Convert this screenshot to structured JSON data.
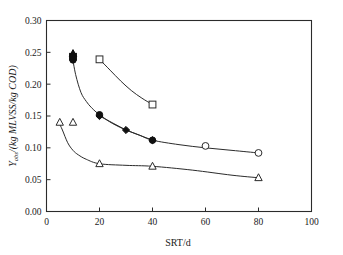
{
  "chart_data": {
    "type": "scatter",
    "title": "",
    "xlabel": "SRT/d",
    "ylabel": "Y_obs/(kg MLVSS/kg COD)",
    "ylabel_main": "Y",
    "ylabel_sub": "obs",
    "ylabel_rest": "/(kg MLVSS/kg COD)",
    "xlim": [
      0,
      100
    ],
    "ylim": [
      0.0,
      0.3
    ],
    "xticks": [
      0,
      20,
      40,
      60,
      80,
      100
    ],
    "xtick_labels": [
      "0",
      "20",
      "40",
      "60",
      "80",
      "100"
    ],
    "yticks": [
      0.0,
      0.05,
      0.1,
      0.15,
      0.2,
      0.25,
      0.3
    ],
    "ytick_labels": [
      "0.00",
      "0.05",
      "0.10",
      "0.15",
      "0.20",
      "0.25",
      "0.30"
    ],
    "grid": false,
    "legend": "none",
    "line_color": "#2b2b2b",
    "marker_open_fill": "#ffffff",
    "marker_filled_fill": "#101010",
    "series": [
      {
        "name": "open-square-series",
        "marker": "open-square",
        "x": [
          20,
          40
        ],
        "values": [
          0.239,
          0.168
        ],
        "curve_x": [
          20,
          24,
          28,
          32,
          36,
          40
        ],
        "curve_y": [
          0.239,
          0.222,
          0.205,
          0.19,
          0.178,
          0.168
        ]
      },
      {
        "name": "filled-cluster-series",
        "marker": "filled-mixed",
        "x": [
          10,
          10,
          10
        ],
        "values": [
          0.248,
          0.243,
          0.238
        ]
      },
      {
        "name": "filled-circle-series",
        "marker": "filled-circle",
        "x": [
          10,
          20,
          40
        ],
        "values": [
          0.243,
          0.152,
          0.112
        ],
        "curve_x": [
          9.6,
          11,
          13,
          15,
          17,
          20,
          25,
          30,
          35,
          40,
          50,
          60,
          70,
          80
        ],
        "curve_y": [
          0.247,
          0.215,
          0.187,
          0.173,
          0.163,
          0.152,
          0.138,
          0.128,
          0.12,
          0.112,
          0.105,
          0.1,
          0.096,
          0.092
        ]
      },
      {
        "name": "filled-diamond-series",
        "marker": "filled-diamond",
        "x": [
          20,
          30,
          40
        ],
        "values": [
          0.15,
          0.128,
          0.112
        ]
      },
      {
        "name": "open-circle-series",
        "marker": "open-circle",
        "x": [
          60,
          80
        ],
        "values": [
          0.103,
          0.092
        ]
      },
      {
        "name": "open-triangle-series",
        "marker": "open-triangle",
        "x": [
          5,
          10,
          20,
          40,
          80
        ],
        "values": [
          0.14,
          0.14,
          0.075,
          0.071,
          0.053
        ],
        "curve_x": [
          4.6,
          6,
          8,
          10,
          12,
          15,
          20,
          30,
          40,
          55,
          70,
          80
        ],
        "curve_y": [
          0.141,
          0.128,
          0.108,
          0.096,
          0.089,
          0.082,
          0.075,
          0.0725,
          0.071,
          0.065,
          0.057,
          0.053
        ]
      }
    ]
  }
}
